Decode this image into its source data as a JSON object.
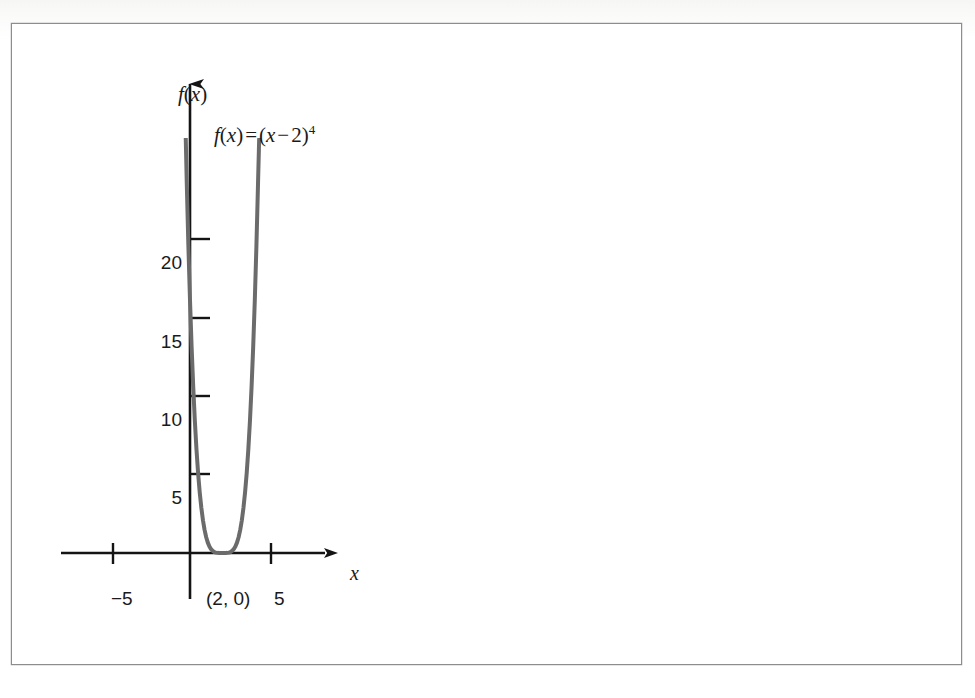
{
  "figure": {
    "title_label": "f(x)",
    "equation": {
      "lhs_f": "f",
      "lhs_open": "(",
      "lhs_var": "x",
      "lhs_close": ")",
      "equals": "=",
      "rhs_open": "(",
      "rhs_var": "x",
      "rhs_minus": "−",
      "rhs_const": "2",
      "rhs_close": ")",
      "rhs_exponent": "4",
      "plain": "f(x) = (x − 2)⁴"
    },
    "axis_labels": {
      "x": "x",
      "y": "f(x)"
    },
    "vertex_label": "(2, 0)",
    "frame_color": "#8d8d8f",
    "curve_color": "#6b6b6b",
    "axis_color": "#141414",
    "background_color": "#ffffff"
  },
  "chart_data": {
    "type": "line",
    "title": "",
    "subtitle": "",
    "xlabel": "x",
    "ylabel": "f(x)",
    "function": "f(x) = (x - 2)^4",
    "annotations": [
      {
        "text": "f(x) = (x − 2)⁴",
        "x": 3.0,
        "y": 27.5
      },
      {
        "text": "(2, 0)",
        "x": 2.0,
        "y": -1.6
      }
    ],
    "legend": [],
    "legend_position": "none",
    "grid": false,
    "xlim": [
      -8.0,
      8.7
    ],
    "ylim": [
      -3.0,
      26.5
    ],
    "xticks": [
      -5,
      5
    ],
    "xtick_labels": [
      "−5",
      "5"
    ],
    "yticks": [
      5,
      10,
      15,
      20
    ],
    "ytick_labels": [
      "5",
      "10",
      "15",
      "20"
    ],
    "axis_arrows": {
      "x": "right",
      "y": "up"
    },
    "series": [
      {
        "name": "f(x) = (x - 2)^4",
        "color": "#6b6b6b",
        "linewidth": 4,
        "x": [
          -0.3,
          -0.2,
          -0.1,
          0.0,
          0.1,
          0.2,
          0.3,
          0.4,
          0.5,
          0.6,
          0.7,
          0.8,
          0.9,
          1.0,
          1.1,
          1.2,
          1.3,
          1.4,
          1.5,
          1.6,
          1.7,
          1.8,
          1.9,
          2.0,
          2.1,
          2.2,
          2.3,
          2.4,
          2.5,
          2.6,
          2.7,
          2.8,
          2.9,
          3.0,
          3.1,
          3.2,
          3.3,
          3.4,
          3.5,
          3.6,
          3.7,
          3.8,
          3.9,
          4.0,
          4.1,
          4.2,
          4.27
        ],
        "y": [
          27.98,
          23.43,
          19.45,
          16.0,
          13.03,
          10.5,
          8.35,
          6.55,
          5.06,
          3.84,
          2.86,
          2.07,
          1.46,
          1.0,
          0.656,
          0.41,
          0.24,
          0.13,
          0.0625,
          0.0256,
          0.0081,
          0.0016,
          0.0001,
          0.0,
          0.0001,
          0.0016,
          0.0081,
          0.0256,
          0.0625,
          0.13,
          0.24,
          0.41,
          0.656,
          1.0,
          1.46,
          2.07,
          2.86,
          3.84,
          5.06,
          6.55,
          8.35,
          10.5,
          13.03,
          16.0,
          19.45,
          23.43,
          26.2
        ]
      }
    ],
    "key_points": [
      {
        "label": "(2, 0)",
        "x": 2,
        "y": 0,
        "description": "minimum / vertex, quadruple root"
      }
    ]
  }
}
